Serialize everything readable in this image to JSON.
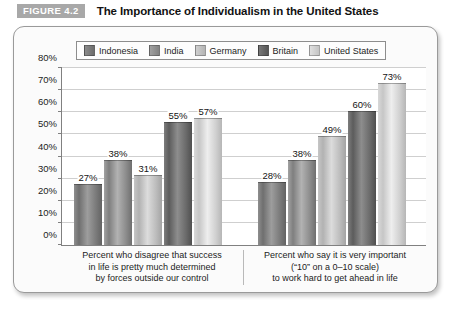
{
  "header": {
    "badge": "FIGURE 4.2",
    "title": "The Importance of Individualism in the United States"
  },
  "chart_data": {
    "type": "bar",
    "title": "The Importance of Individualism in the United States",
    "xlabel": "",
    "ylabel": "",
    "ylim": [
      0,
      80
    ],
    "grid": true,
    "legend_position": "top",
    "yticks": [
      "0%",
      "10%",
      "20%",
      "30%",
      "40%",
      "50%",
      "60%",
      "70%",
      "80%"
    ],
    "ytick_values": [
      0,
      10,
      20,
      30,
      40,
      50,
      60,
      70,
      80
    ],
    "categories": [
      "Percent who disagree that success in life is pretty much determined by forces outside our control",
      "Percent who say it is very important (“10” on a 0–10 scale) to work hard to get ahead in life"
    ],
    "category_lines": [
      [
        "Percent who disagree that success",
        "in life is pretty much determined",
        "by forces outside our control"
      ],
      [
        "Percent who say it is very important",
        "(“10” on a 0–10 scale)",
        "to work hard to get ahead in life"
      ]
    ],
    "series": [
      {
        "name": "Indonesia",
        "values": [
          27,
          28
        ],
        "labels": [
          "27%",
          "28%"
        ],
        "color": "#7d7d7d"
      },
      {
        "name": "India",
        "values": [
          38,
          38
        ],
        "labels": [
          "38%",
          "38%"
        ],
        "color": "#949494"
      },
      {
        "name": "Germany",
        "values": [
          31,
          49
        ],
        "labels": [
          "31%",
          "49%"
        ],
        "color": "#c6c6c6"
      },
      {
        "name": "Britain",
        "values": [
          55,
          60
        ],
        "labels": [
          "55%",
          "60%"
        ],
        "color": "#666666"
      },
      {
        "name": "United States",
        "values": [
          57,
          73
        ],
        "labels": [
          "57%",
          "73%"
        ],
        "color": "#dcdcdc"
      }
    ]
  }
}
